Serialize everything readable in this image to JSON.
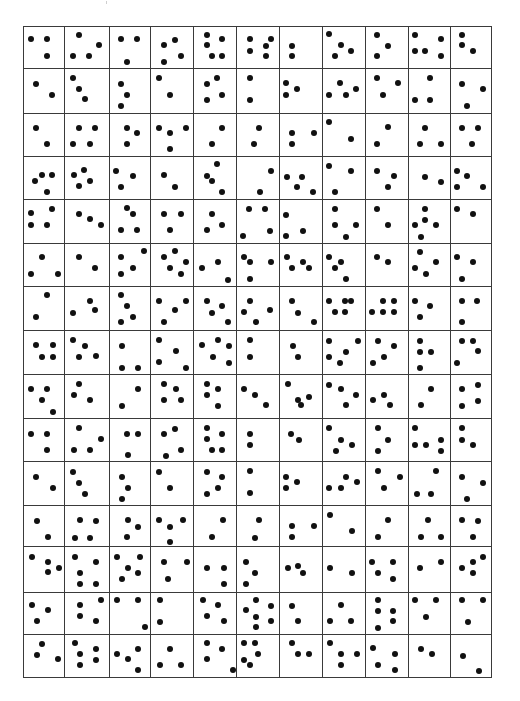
{
  "figure": {
    "rows": 15,
    "columns": 11,
    "line_color": "#3a3a3a",
    "dot_color": "#111111",
    "background": "#ffffff",
    "col_edges": [
      23,
      64,
      109,
      150,
      193,
      236,
      279,
      322,
      365,
      408,
      450,
      491
    ],
    "row_edges": [
      26,
      68,
      113,
      156,
      199,
      243,
      286,
      330,
      374,
      418,
      461,
      505,
      546,
      592,
      634,
      677
    ]
  },
  "dots": [
    [
      31,
      39
    ],
    [
      47,
      39
    ],
    [
      47,
      56
    ],
    [
      79,
      35
    ],
    [
      99,
      45
    ],
    [
      73,
      56
    ],
    [
      89,
      56
    ],
    [
      121,
      39
    ],
    [
      137,
      39
    ],
    [
      127,
      62
    ],
    [
      164,
      45
    ],
    [
      175,
      40
    ],
    [
      181,
      56
    ],
    [
      164,
      62
    ],
    [
      207,
      35
    ],
    [
      207,
      45
    ],
    [
      222,
      39
    ],
    [
      212,
      56
    ],
    [
      222,
      56
    ],
    [
      250,
      39
    ],
    [
      250,
      51
    ],
    [
      266,
      46
    ],
    [
      266,
      56
    ],
    [
      271,
      39
    ],
    [
      292,
      46
    ],
    [
      292,
      56
    ],
    [
      329,
      34
    ],
    [
      341,
      45
    ],
    [
      351,
      51
    ],
    [
      335,
      56
    ],
    [
      377,
      35
    ],
    [
      388,
      46
    ],
    [
      377,
      56
    ],
    [
      415,
      35
    ],
    [
      441,
      39
    ],
    [
      415,
      51
    ],
    [
      425,
      51
    ],
    [
      441,
      56
    ],
    [
      462,
      35
    ],
    [
      462,
      45
    ],
    [
      473,
      51
    ],
    [
      36,
      84
    ],
    [
      52,
      95
    ],
    [
      73,
      78
    ],
    [
      79,
      89
    ],
    [
      85,
      99
    ],
    [
      121,
      84
    ],
    [
      127,
      95
    ],
    [
      121,
      106
    ],
    [
      159,
      78
    ],
    [
      170,
      95
    ],
    [
      207,
      84
    ],
    [
      217,
      78
    ],
    [
      222,
      95
    ],
    [
      207,
      100
    ],
    [
      250,
      78
    ],
    [
      250,
      100
    ],
    [
      286,
      83
    ],
    [
      286,
      95
    ],
    [
      297,
      89
    ],
    [
      329,
      95
    ],
    [
      340,
      83
    ],
    [
      346,
      95
    ],
    [
      356,
      89
    ],
    [
      377,
      78
    ],
    [
      398,
      83
    ],
    [
      383,
      95
    ],
    [
      430,
      78
    ],
    [
      415,
      100
    ],
    [
      430,
      100
    ],
    [
      462,
      84
    ],
    [
      483,
      89
    ],
    [
      467,
      106
    ],
    [
      36,
      128
    ],
    [
      47,
      144
    ],
    [
      79,
      128
    ],
    [
      95,
      128
    ],
    [
      73,
      144
    ],
    [
      90,
      144
    ],
    [
      127,
      128
    ],
    [
      137,
      133
    ],
    [
      127,
      144
    ],
    [
      159,
      128
    ],
    [
      170,
      133
    ],
    [
      186,
      128
    ],
    [
      170,
      149
    ],
    [
      222,
      128
    ],
    [
      212,
      144
    ],
    [
      259,
      128
    ],
    [
      254,
      144
    ],
    [
      292,
      133
    ],
    [
      292,
      144
    ],
    [
      314,
      133
    ],
    [
      329,
      122
    ],
    [
      351,
      139
    ],
    [
      388,
      127
    ],
    [
      377,
      144
    ],
    [
      425,
      128
    ],
    [
      420,
      144
    ],
    [
      441,
      144
    ],
    [
      462,
      128
    ],
    [
      478,
      128
    ],
    [
      472,
      144
    ],
    [
      35,
      181
    ],
    [
      42,
      175
    ],
    [
      52,
      175
    ],
    [
      47,
      192
    ],
    [
      74,
      175
    ],
    [
      84,
      170
    ],
    [
      79,
      186
    ],
    [
      90,
      181
    ],
    [
      116,
      171
    ],
    [
      133,
      176
    ],
    [
      121,
      187
    ],
    [
      164,
      175
    ],
    [
      175,
      187
    ],
    [
      207,
      176
    ],
    [
      212,
      181
    ],
    [
      222,
      192
    ],
    [
      217,
      164
    ],
    [
      260,
      192
    ],
    [
      271,
      171
    ],
    [
      287,
      177
    ],
    [
      302,
      177
    ],
    [
      297,
      187
    ],
    [
      313,
      192
    ],
    [
      329,
      166
    ],
    [
      351,
      171
    ],
    [
      335,
      192
    ],
    [
      377,
      171
    ],
    [
      394,
      176
    ],
    [
      388,
      187
    ],
    [
      425,
      177
    ],
    [
      441,
      182
    ],
    [
      457,
      171
    ],
    [
      467,
      176
    ],
    [
      457,
      187
    ],
    [
      483,
      187
    ],
    [
      31,
      213
    ],
    [
      52,
      209
    ],
    [
      31,
      225
    ],
    [
      47,
      225
    ],
    [
      79,
      214
    ],
    [
      90,
      219
    ],
    [
      101,
      225
    ],
    [
      127,
      208
    ],
    [
      133,
      214
    ],
    [
      121,
      230
    ],
    [
      137,
      230
    ],
    [
      164,
      214
    ],
    [
      181,
      214
    ],
    [
      170,
      230
    ],
    [
      212,
      214
    ],
    [
      222,
      225
    ],
    [
      207,
      230
    ],
    [
      249,
      209
    ],
    [
      265,
      209
    ],
    [
      270,
      231
    ],
    [
      243,
      236
    ],
    [
      286,
      215
    ],
    [
      286,
      236
    ],
    [
      303,
      231
    ],
    [
      335,
      209
    ],
    [
      335,
      225
    ],
    [
      356,
      225
    ],
    [
      346,
      237
    ],
    [
      377,
      209
    ],
    [
      388,
      225
    ],
    [
      425,
      209
    ],
    [
      425,
      220
    ],
    [
      415,
      225
    ],
    [
      436,
      225
    ],
    [
      421,
      237
    ],
    [
      457,
      209
    ],
    [
      473,
      214
    ],
    [
      42,
      257
    ],
    [
      31,
      274
    ],
    [
      58,
      274
    ],
    [
      79,
      257
    ],
    [
      95,
      268
    ],
    [
      121,
      257
    ],
    [
      144,
      251
    ],
    [
      133,
      268
    ],
    [
      121,
      274
    ],
    [
      164,
      257
    ],
    [
      175,
      251
    ],
    [
      186,
      262
    ],
    [
      170,
      268
    ],
    [
      181,
      274
    ],
    [
      202,
      268
    ],
    [
      218,
      262
    ],
    [
      228,
      280
    ],
    [
      244,
      257
    ],
    [
      250,
      262
    ],
    [
      250,
      279
    ],
    [
      271,
      262
    ],
    [
      287,
      257
    ],
    [
      292,
      268
    ],
    [
      303,
      262
    ],
    [
      309,
      268
    ],
    [
      329,
      257
    ],
    [
      341,
      262
    ],
    [
      335,
      268
    ],
    [
      346,
      279
    ],
    [
      377,
      257
    ],
    [
      388,
      262
    ],
    [
      420,
      252
    ],
    [
      415,
      268
    ],
    [
      426,
      274
    ],
    [
      436,
      262
    ],
    [
      457,
      257
    ],
    [
      473,
      262
    ],
    [
      462,
      279
    ],
    [
      47,
      295
    ],
    [
      36,
      317
    ],
    [
      90,
      301
    ],
    [
      73,
      313
    ],
    [
      95,
      310
    ],
    [
      121,
      295
    ],
    [
      127,
      306
    ],
    [
      133,
      317
    ],
    [
      121,
      322
    ],
    [
      159,
      301
    ],
    [
      175,
      310
    ],
    [
      186,
      301
    ],
    [
      164,
      322
    ],
    [
      207,
      301
    ],
    [
      222,
      306
    ],
    [
      212,
      313
    ],
    [
      228,
      322
    ],
    [
      250,
      301
    ],
    [
      244,
      312
    ],
    [
      270,
      310
    ],
    [
      256,
      322
    ],
    [
      292,
      301
    ],
    [
      298,
      313
    ],
    [
      314,
      322
    ],
    [
      329,
      301
    ],
    [
      345,
      301
    ],
    [
      351,
      301
    ],
    [
      335,
      312
    ],
    [
      345,
      312
    ],
    [
      372,
      312
    ],
    [
      383,
      312
    ],
    [
      394,
      312
    ],
    [
      383,
      301
    ],
    [
      394,
      301
    ],
    [
      415,
      301
    ],
    [
      430,
      306
    ],
    [
      420,
      317
    ],
    [
      462,
      301
    ],
    [
      477,
      301
    ],
    [
      462,
      322
    ],
    [
      36,
      345
    ],
    [
      53,
      345
    ],
    [
      42,
      357
    ],
    [
      53,
      357
    ],
    [
      73,
      340
    ],
    [
      85,
      346
    ],
    [
      79,
      357
    ],
    [
      96,
      356
    ],
    [
      122,
      346
    ],
    [
      122,
      368
    ],
    [
      138,
      368
    ],
    [
      159,
      340
    ],
    [
      176,
      351
    ],
    [
      159,
      362
    ],
    [
      186,
      368
    ],
    [
      202,
      345
    ],
    [
      218,
      340
    ],
    [
      213,
      357
    ],
    [
      229,
      346
    ],
    [
      229,
      363
    ],
    [
      250,
      340
    ],
    [
      250,
      357
    ],
    [
      293,
      346
    ],
    [
      298,
      357
    ],
    [
      329,
      341
    ],
    [
      346,
      352
    ],
    [
      329,
      357
    ],
    [
      340,
      363
    ],
    [
      358,
      341
    ],
    [
      378,
      341
    ],
    [
      394,
      346
    ],
    [
      373,
      363
    ],
    [
      384,
      357
    ],
    [
      420,
      341
    ],
    [
      420,
      352
    ],
    [
      431,
      352
    ],
    [
      420,
      368
    ],
    [
      462,
      341
    ],
    [
      473,
      341
    ],
    [
      478,
      351
    ],
    [
      457,
      363
    ],
    [
      31,
      389
    ],
    [
      47,
      389
    ],
    [
      42,
      400
    ],
    [
      53,
      412
    ],
    [
      79,
      384
    ],
    [
      74,
      395
    ],
    [
      90,
      400
    ],
    [
      138,
      389
    ],
    [
      122,
      406
    ],
    [
      164,
      384
    ],
    [
      176,
      389
    ],
    [
      164,
      400
    ],
    [
      181,
      400
    ],
    [
      207,
      384
    ],
    [
      218,
      389
    ],
    [
      207,
      395
    ],
    [
      218,
      406
    ],
    [
      244,
      389
    ],
    [
      255,
      395
    ],
    [
      266,
      405
    ],
    [
      288,
      384
    ],
    [
      298,
      400
    ],
    [
      301,
      405
    ],
    [
      309,
      397
    ],
    [
      329,
      385
    ],
    [
      341,
      389
    ],
    [
      356,
      395
    ],
    [
      346,
      405
    ],
    [
      373,
      400
    ],
    [
      384,
      395
    ],
    [
      390,
      405
    ],
    [
      431,
      389
    ],
    [
      421,
      405
    ],
    [
      462,
      389
    ],
    [
      478,
      385
    ],
    [
      478,
      401
    ],
    [
      462,
      406
    ],
    [
      31,
      434
    ],
    [
      47,
      434
    ],
    [
      47,
      450
    ],
    [
      79,
      428
    ],
    [
      101,
      439
    ],
    [
      74,
      450
    ],
    [
      90,
      450
    ],
    [
      127,
      434
    ],
    [
      138,
      434
    ],
    [
      128,
      455
    ],
    [
      164,
      434
    ],
    [
      175,
      429
    ],
    [
      181,
      450
    ],
    [
      166,
      456
    ],
    [
      207,
      428
    ],
    [
      222,
      434
    ],
    [
      207,
      439
    ],
    [
      212,
      450
    ],
    [
      222,
      450
    ],
    [
      250,
      434
    ],
    [
      250,
      445
    ],
    [
      291,
      434
    ],
    [
      299,
      440
    ],
    [
      329,
      428
    ],
    [
      341,
      440
    ],
    [
      352,
      445
    ],
    [
      336,
      451
    ],
    [
      378,
      428
    ],
    [
      388,
      440
    ],
    [
      378,
      451
    ],
    [
      415,
      428
    ],
    [
      415,
      445
    ],
    [
      426,
      445
    ],
    [
      441,
      440
    ],
    [
      441,
      451
    ],
    [
      462,
      428
    ],
    [
      462,
      440
    ],
    [
      473,
      445
    ],
    [
      36,
      477
    ],
    [
      53,
      488
    ],
    [
      73,
      472
    ],
    [
      79,
      483
    ],
    [
      85,
      494
    ],
    [
      122,
      477
    ],
    [
      128,
      488
    ],
    [
      122,
      499
    ],
    [
      159,
      472
    ],
    [
      170,
      488
    ],
    [
      207,
      472
    ],
    [
      207,
      494
    ],
    [
      218,
      488
    ],
    [
      222,
      477
    ],
    [
      250,
      471
    ],
    [
      250,
      493
    ],
    [
      286,
      477
    ],
    [
      286,
      488
    ],
    [
      297,
      482
    ],
    [
      329,
      488
    ],
    [
      346,
      477
    ],
    [
      341,
      488
    ],
    [
      357,
      482
    ],
    [
      378,
      471
    ],
    [
      384,
      488
    ],
    [
      400,
      477
    ],
    [
      436,
      471
    ],
    [
      417,
      494
    ],
    [
      431,
      494
    ],
    [
      462,
      477
    ],
    [
      483,
      483
    ],
    [
      467,
      499
    ],
    [
      37,
      521
    ],
    [
      48,
      537
    ],
    [
      80,
      520
    ],
    [
      96,
      521
    ],
    [
      75,
      538
    ],
    [
      90,
      538
    ],
    [
      128,
      520
    ],
    [
      138,
      527
    ],
    [
      127,
      537
    ],
    [
      159,
      520
    ],
    [
      170,
      527
    ],
    [
      183,
      520
    ],
    [
      170,
      542
    ],
    [
      223,
      520
    ],
    [
      212,
      537
    ],
    [
      259,
      520
    ],
    [
      255,
      538
    ],
    [
      292,
      526
    ],
    [
      292,
      537
    ],
    [
      314,
      526
    ],
    [
      330,
      515
    ],
    [
      352,
      531
    ],
    [
      388,
      520
    ],
    [
      378,
      537
    ],
    [
      428,
      520
    ],
    [
      421,
      537
    ],
    [
      441,
      537
    ],
    [
      462,
      520
    ],
    [
      478,
      521
    ],
    [
      473,
      537
    ],
    [
      32,
      557
    ],
    [
      48,
      562
    ],
    [
      48,
      572
    ],
    [
      59,
      568
    ],
    [
      75,
      557
    ],
    [
      96,
      562
    ],
    [
      80,
      573
    ],
    [
      80,
      584
    ],
    [
      96,
      584
    ],
    [
      117,
      557
    ],
    [
      140,
      557
    ],
    [
      128,
      568
    ],
    [
      122,
      579
    ],
    [
      138,
      573
    ],
    [
      164,
      562
    ],
    [
      187,
      562
    ],
    [
      168,
      579
    ],
    [
      207,
      568
    ],
    [
      224,
      568
    ],
    [
      224,
      584
    ],
    [
      246,
      562
    ],
    [
      255,
      573
    ],
    [
      246,
      584
    ],
    [
      288,
      568
    ],
    [
      298,
      566
    ],
    [
      303,
      573
    ],
    [
      330,
      568
    ],
    [
      352,
      573
    ],
    [
      372,
      562
    ],
    [
      393,
      562
    ],
    [
      378,
      573
    ],
    [
      393,
      579
    ],
    [
      420,
      568
    ],
    [
      441,
      562
    ],
    [
      462,
      568
    ],
    [
      473,
      562
    ],
    [
      473,
      573
    ],
    [
      483,
      557
    ],
    [
      32,
      605
    ],
    [
      48,
      610
    ],
    [
      37,
      621
    ],
    [
      80,
      605
    ],
    [
      101,
      600
    ],
    [
      80,
      616
    ],
    [
      96,
      621
    ],
    [
      117,
      600
    ],
    [
      138,
      600
    ],
    [
      145,
      627
    ],
    [
      160,
      600
    ],
    [
      160,
      622
    ],
    [
      203,
      600
    ],
    [
      218,
      605
    ],
    [
      207,
      616
    ],
    [
      224,
      621
    ],
    [
      256,
      600
    ],
    [
      246,
      610
    ],
    [
      256,
      617
    ],
    [
      256,
      627
    ],
    [
      271,
      606
    ],
    [
      271,
      621
    ],
    [
      292,
      606
    ],
    [
      298,
      621
    ],
    [
      341,
      605
    ],
    [
      330,
      621
    ],
    [
      351,
      621
    ],
    [
      378,
      600
    ],
    [
      378,
      611
    ],
    [
      378,
      628
    ],
    [
      393,
      611
    ],
    [
      393,
      621
    ],
    [
      415,
      600
    ],
    [
      436,
      600
    ],
    [
      426,
      617
    ],
    [
      462,
      600
    ],
    [
      483,
      600
    ],
    [
      468,
      622
    ]
  ],
  "dots_row15": [
    [
      42,
      644
    ],
    [
      37,
      655
    ],
    [
      58,
      659
    ],
    [
      75,
      643
    ],
    [
      80,
      654
    ],
    [
      96,
      649
    ],
    [
      80,
      665
    ],
    [
      96,
      660
    ],
    [
      117,
      654
    ],
    [
      128,
      659
    ],
    [
      138,
      649
    ],
    [
      138,
      670
    ],
    [
      170,
      649
    ],
    [
      160,
      665
    ],
    [
      181,
      665
    ],
    [
      207,
      643
    ],
    [
      207,
      659
    ],
    [
      222,
      649
    ],
    [
      233,
      670
    ],
    [
      244,
      643
    ],
    [
      255,
      643
    ],
    [
      244,
      660
    ],
    [
      250,
      665
    ],
    [
      258,
      654
    ],
    [
      292,
      643
    ],
    [
      298,
      654
    ],
    [
      309,
      654
    ],
    [
      330,
      643
    ],
    [
      341,
      654
    ],
    [
      357,
      654
    ],
    [
      341,
      665
    ],
    [
      373,
      648
    ],
    [
      378,
      665
    ],
    [
      395,
      654
    ],
    [
      395,
      670
    ],
    [
      421,
      649
    ],
    [
      432,
      654
    ],
    [
      463,
      656
    ],
    [
      479,
      671
    ]
  ],
  "annotations": {
    "tick_mark": "faint mark above grid"
  }
}
